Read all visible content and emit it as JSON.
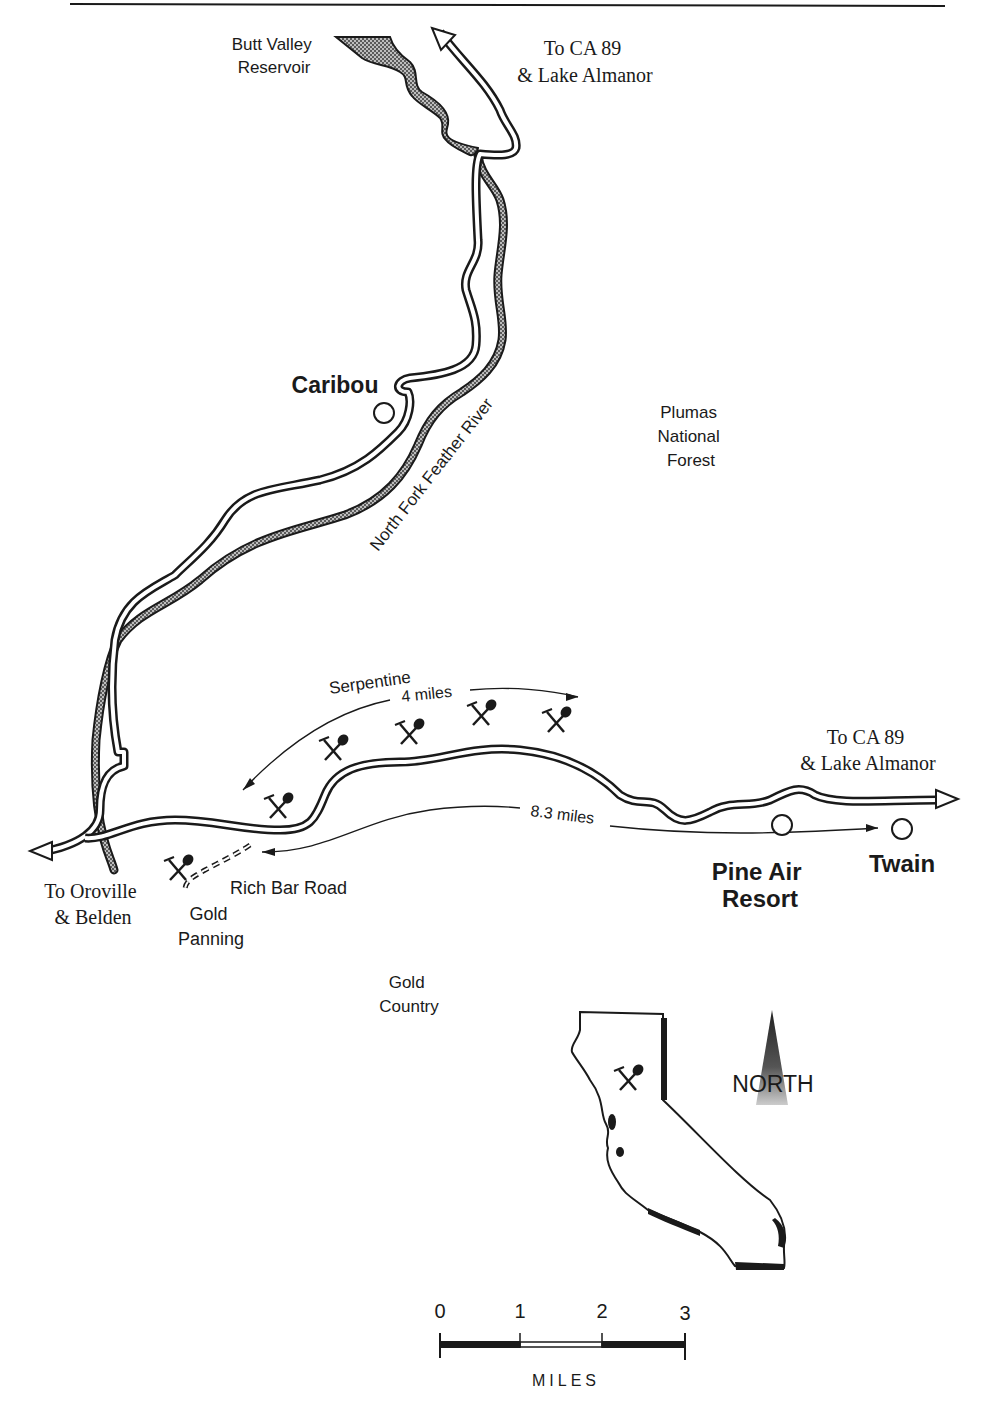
{
  "map": {
    "labels": {
      "reservoir": [
        "Butt Valley",
        "Reservoir"
      ],
      "to_ca89_north": [
        "To CA 89",
        "& Lake Almanor"
      ],
      "caribou": "Caribou",
      "forest": [
        "Plumas",
        "National",
        "Forest"
      ],
      "river": "North Fork Feather River",
      "serpentine": "Serpentine",
      "serpentine_distance": "4 miles",
      "to_ca89_east": [
        "To CA 89",
        "& Lake Almanor"
      ],
      "route_distance": "8.3 miles",
      "to_oroville": [
        "To Oroville",
        "& Belden"
      ],
      "rich_bar_road": "Rich Bar Road",
      "gold_panning": [
        "Gold",
        "Panning"
      ],
      "pine_air": [
        "Pine Air",
        "Resort"
      ],
      "twain": "Twain",
      "gold_country": [
        "Gold",
        "Country"
      ]
    },
    "inset": {
      "north_label": "NORTH"
    },
    "scale_bar": {
      "ticks": [
        "0",
        "1",
        "2",
        "3"
      ],
      "unit": "MILES"
    },
    "colors": {
      "ink": "#1a1a1a",
      "reservoir_fill": "#8a8a8a",
      "background": "#ffffff"
    }
  }
}
